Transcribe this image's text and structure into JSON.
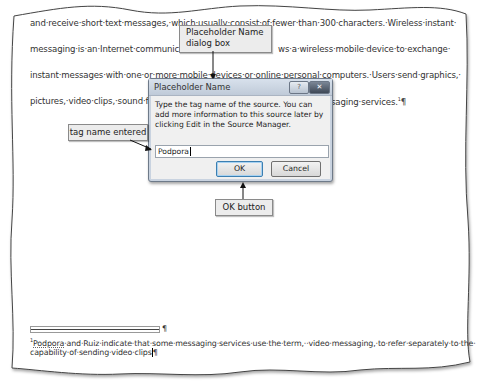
{
  "document": {
    "body_lines": [
      "and·receive·short·text·messages,·which·usually·consist·of·fewer·than·300·characters.·Wireless·instant·",
      "messaging·is·an·Internet·communica",
      "ws·a·wireless·mobile·device·to·exchange·",
      "instant·messages·with·one·or·more·mobile·devices·or·online·personal·computers.·Users·send·graphics,·",
      "pictures,·video·clips,·sound·fi",
      "saging·services.",
      "¶"
    ],
    "footnote": {
      "separator_mark": "¶",
      "ref_number": "1",
      "author": "Podpora",
      "line1_rest": "·and·Ruiz·indicate·that·some·messaging·services·use·the·term,··video·messaging,·to·refer·separately·to·the·",
      "line2": "capability·of·sending·video·clips",
      "end_mark": "¶"
    },
    "footnote_ref_in_body": "1"
  },
  "dialog": {
    "title": "Placeholder Name",
    "help_button": "?",
    "close_button": "✕",
    "message": "Type the tag name of the source. You can add more information to this source later by clicking Edit in the Source Manager.",
    "input_value": "Podpora",
    "ok_label": "OK",
    "cancel_label": "Cancel"
  },
  "callouts": {
    "dialog_box": "Placeholder Name dialog box",
    "dialog_box_line1": "Placeholder Name",
    "dialog_box_line2": "dialog box",
    "tag_name": "tag name entered",
    "ok_button": "OK button"
  }
}
